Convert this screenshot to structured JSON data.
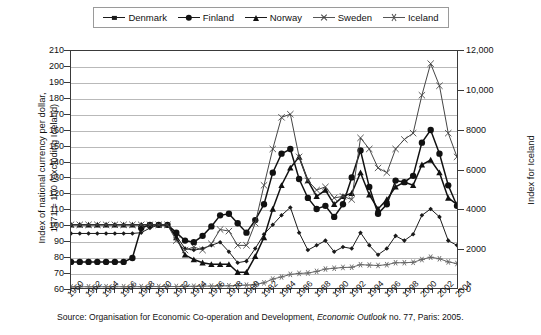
{
  "legend": {
    "position": "top",
    "items": [
      {
        "label": "Denmark",
        "marker": "diamond",
        "color": "#1a1a1a"
      },
      {
        "label": "Finland",
        "marker": "circle",
        "color": "#111111"
      },
      {
        "label": "Norway",
        "marker": "triangle",
        "color": "#111111"
      },
      {
        "label": "Sweden",
        "marker": "cross",
        "color": "#444444"
      },
      {
        "label": "Iceland",
        "marker": "star",
        "color": "#555555"
      }
    ]
  },
  "axes": {
    "left_title_line1": "Index of national currency per dollar,",
    "left_title_line2": "1971 = 100 (excluding Iceland)",
    "right_title": "Index for Iceland",
    "left_ticks": [
      "210",
      "200",
      "190",
      "180",
      "170",
      "160",
      "150",
      "140",
      "130",
      "120",
      "110",
      "100",
      "90",
      "80",
      "70",
      "60"
    ],
    "right_ticks": [
      "12,000",
      "10,000",
      "8000",
      "6000",
      "4000",
      "2000",
      "0"
    ],
    "x_ticks": [
      "1960",
      "1962",
      "1964",
      "1966",
      "1968",
      "1970",
      "1972",
      "1974",
      "1976",
      "1978",
      "1980",
      "1982",
      "1984",
      "1986",
      "1988",
      "1990",
      "1992",
      "1994",
      "1996",
      "1998",
      "2000",
      "2002",
      "2004"
    ]
  },
  "source": {
    "prefix": "Source: Organisation for Economic Co-operation and Development, ",
    "italic": "Economic Outlook",
    "suffix": " no. 77, Paris: 2005."
  },
  "chart_data": {
    "type": "line",
    "title": "",
    "xlabel": "",
    "ylabel": "Index of national currency per dollar, 1971 = 100 (excluding Iceland)",
    "ylabel_right": "Index for Iceland",
    "ylim": [
      60,
      210
    ],
    "ylim_right": [
      0,
      12000
    ],
    "xlim": [
      1960,
      2004
    ],
    "grid": true,
    "legend_position": "top",
    "x": [
      1960,
      1961,
      1962,
      1963,
      1964,
      1965,
      1966,
      1967,
      1968,
      1969,
      1970,
      1971,
      1972,
      1973,
      1974,
      1975,
      1976,
      1977,
      1978,
      1979,
      1980,
      1981,
      1982,
      1983,
      1984,
      1985,
      1986,
      1987,
      1988,
      1989,
      1990,
      1991,
      1992,
      1993,
      1994,
      1995,
      1996,
      1997,
      1998,
      1999,
      2000,
      2001,
      2002,
      2003,
      2004
    ],
    "series": [
      {
        "name": "Denmark",
        "axis": "left",
        "marker": "diamond",
        "values": [
          94.5,
          94.5,
          94.5,
          94.5,
          94.5,
          94.5,
          94.5,
          94.5,
          95,
          98,
          100,
          100,
          93,
          85,
          84,
          85,
          87,
          89,
          83,
          76,
          77,
          85,
          94,
          100,
          106,
          111,
          95,
          84,
          87,
          90,
          83,
          86,
          85,
          95,
          87,
          81,
          85,
          93,
          90,
          94,
          106,
          110,
          105,
          90,
          87
        ]
      },
      {
        "name": "Finland",
        "axis": "left",
        "marker": "circle",
        "values": [
          76.5,
          76.5,
          76.5,
          76.5,
          76.5,
          76.5,
          76.5,
          79,
          98,
          100,
          100,
          100,
          95,
          90,
          89,
          93,
          99,
          106,
          107,
          101,
          95,
          103,
          113,
          133,
          145,
          148,
          129,
          117,
          110,
          112,
          105,
          113,
          130,
          147,
          124,
          107,
          113,
          128,
          127,
          131,
          152,
          160,
          145,
          125,
          112
        ]
      },
      {
        "name": "Norway",
        "axis": "left",
        "marker": "triangle",
        "values": [
          100,
          100,
          100,
          100,
          100,
          100,
          100,
          100,
          100,
          100,
          100,
          100,
          92,
          81,
          78,
          76,
          75,
          75,
          75,
          70,
          70,
          80,
          92,
          110,
          125,
          136,
          143,
          128,
          118,
          122,
          113,
          118,
          120,
          133,
          119,
          110,
          116,
          124,
          127,
          125,
          138,
          141,
          133,
          117,
          113
        ]
      },
      {
        "name": "Sweden",
        "axis": "left",
        "marker": "cross",
        "values": [
          100,
          100,
          100,
          100,
          100,
          100,
          100,
          100,
          100,
          100,
          100,
          100,
          90,
          84,
          86,
          84,
          88,
          97,
          96,
          87,
          87,
          101,
          125,
          148,
          168,
          170,
          143,
          128,
          122,
          124,
          117,
          118,
          116,
          155,
          148,
          136,
          133,
          148,
          154,
          158,
          182,
          202,
          188,
          158,
          143
        ]
      },
      {
        "name": "Iceland",
        "axis": "right",
        "marker": "star",
        "values": [
          60,
          62,
          63,
          64,
          65,
          66,
          66,
          66,
          70,
          72,
          73,
          74,
          76,
          80,
          86,
          92,
          98,
          104,
          112,
          125,
          145,
          180,
          260,
          450,
          560,
          690,
          740,
          760,
          840,
          960,
          1000,
          1040,
          1050,
          1180,
          1160,
          1140,
          1180,
          1280,
          1280,
          1300,
          1440,
          1560,
          1480,
          1320,
          1240
        ]
      }
    ],
    "series_right_native": [
      {
        "name": "Iceland",
        "note": "Iceland values plotted against right axis (Index for Iceland, 0-12,000)",
        "values": [
          0,
          160,
          240,
          320,
          400,
          480,
          480,
          480,
          800,
          960,
          1040,
          1120,
          1280,
          1600,
          2080,
          2560,
          3040,
          3520,
          4160,
          5200,
          6800,
          9600,
          16000,
          0,
          0,
          0,
          0,
          0,
          0,
          0,
          0,
          0,
          0,
          0,
          0,
          0,
          0,
          0,
          0,
          0,
          0,
          0,
          0,
          0,
          0
        ]
      }
    ],
    "annotations": [
      "All Nordic currencies depreciate sharply against the dollar in the early-to-mid 1980s, peaking around 1985.",
      "A second, higher peak occurs around 2001, when Sweden reaches about 202 on the left index."
    ]
  }
}
